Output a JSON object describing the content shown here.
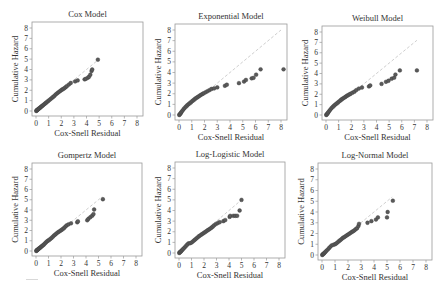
{
  "chart_data": [
    {
      "type": "scatter",
      "title": "Cox Model",
      "xlabel": "Cox-Snell Residual",
      "ylabel": "Cumulative Hazard",
      "xlim": [
        0,
        8
      ],
      "ylim": [
        0,
        8
      ],
      "xticks": [
        0,
        1,
        2,
        3,
        4,
        5,
        6,
        7,
        8
      ],
      "yticks": [
        0,
        1,
        2,
        3,
        4,
        5,
        6,
        7,
        8
      ],
      "grid": false,
      "reference_line": {
        "x": [
          0,
          5
        ],
        "y": [
          0,
          5
        ],
        "style": "dashed",
        "color": "#c8c8c8"
      },
      "x": [
        0.02,
        0.05,
        0.08,
        0.12,
        0.16,
        0.2,
        0.25,
        0.3,
        0.36,
        0.42,
        0.48,
        0.55,
        0.62,
        0.7,
        0.78,
        0.86,
        0.95,
        1.05,
        1.15,
        1.25,
        1.35,
        1.45,
        1.55,
        1.65,
        1.75,
        1.85,
        1.95,
        2.05,
        2.15,
        2.25,
        2.35,
        2.45,
        2.6,
        2.75,
        3.1,
        3.3,
        3.85,
        3.95,
        4.1,
        4.2,
        4.3,
        4.4,
        4.45,
        4.9
      ],
      "y": [
        0.0,
        0.05,
        0.08,
        0.12,
        0.16,
        0.2,
        0.25,
        0.3,
        0.36,
        0.42,
        0.48,
        0.55,
        0.62,
        0.7,
        0.78,
        0.86,
        0.95,
        1.05,
        1.15,
        1.25,
        1.35,
        1.45,
        1.58,
        1.68,
        1.78,
        1.87,
        1.96,
        2.05,
        2.12,
        2.2,
        2.3,
        2.4,
        2.55,
        2.7,
        2.85,
        2.95,
        3.05,
        3.1,
        3.2,
        3.3,
        3.5,
        3.85,
        4.0,
        4.95
      ]
    },
    {
      "type": "scatter",
      "title": "Exponential Model",
      "xlabel": "Cox-Snell Residual",
      "ylabel": "Cumulative Hazard",
      "xlim": [
        0,
        8
      ],
      "ylim": [
        0,
        8
      ],
      "xticks": [
        0,
        1,
        2,
        3,
        4,
        5,
        6,
        7,
        8
      ],
      "yticks": [
        0,
        1,
        2,
        3,
        4,
        5,
        6,
        7,
        8
      ],
      "grid": false,
      "reference_line": {
        "x": [
          0,
          8
        ],
        "y": [
          0,
          8
        ],
        "style": "dashed",
        "color": "#c8c8c8"
      },
      "x": [
        0.02,
        0.05,
        0.1,
        0.15,
        0.2,
        0.28,
        0.36,
        0.45,
        0.55,
        0.65,
        0.75,
        0.85,
        0.95,
        1.05,
        1.15,
        1.25,
        1.35,
        1.45,
        1.55,
        1.65,
        1.75,
        1.85,
        1.95,
        2.1,
        2.25,
        2.4,
        2.55,
        2.75,
        3.0,
        3.6,
        3.75,
        4.7,
        5.1,
        5.25,
        5.7,
        5.85,
        6.05,
        6.4,
        8.2
      ],
      "y": [
        0.0,
        0.05,
        0.12,
        0.2,
        0.3,
        0.42,
        0.55,
        0.68,
        0.8,
        0.92,
        1.02,
        1.12,
        1.22,
        1.32,
        1.42,
        1.52,
        1.6,
        1.68,
        1.76,
        1.84,
        1.92,
        1.98,
        2.05,
        2.15,
        2.25,
        2.35,
        2.45,
        2.5,
        2.6,
        2.75,
        2.85,
        3.0,
        3.15,
        3.3,
        3.45,
        3.5,
        3.8,
        4.3,
        4.3
      ]
    },
    {
      "type": "scatter",
      "title": "Weibull Model",
      "xlabel": "Cox-Snell Residual",
      "ylabel": "Cumulative Hazard",
      "xlim": [
        0,
        8
      ],
      "ylim": [
        0,
        8
      ],
      "xticks": [
        0,
        1,
        2,
        3,
        4,
        5,
        6,
        7,
        8
      ],
      "yticks": [
        0,
        1,
        2,
        3,
        4,
        5,
        6,
        7,
        8
      ],
      "grid": false,
      "reference_line": {
        "x": [
          0,
          7.2
        ],
        "y": [
          0,
          7.2
        ],
        "style": "dashed",
        "color": "#c8c8c8"
      },
      "x": [
        0.02,
        0.05,
        0.1,
        0.15,
        0.2,
        0.28,
        0.36,
        0.45,
        0.55,
        0.65,
        0.75,
        0.85,
        0.95,
        1.05,
        1.15,
        1.25,
        1.35,
        1.45,
        1.55,
        1.65,
        1.75,
        1.85,
        1.95,
        2.1,
        2.25,
        2.4,
        2.6,
        2.85,
        3.4,
        3.5,
        4.4,
        4.75,
        4.95,
        5.2,
        5.4,
        5.5,
        5.85,
        7.2
      ],
      "y": [
        0.0,
        0.05,
        0.12,
        0.2,
        0.3,
        0.42,
        0.55,
        0.68,
        0.8,
        0.92,
        1.02,
        1.12,
        1.22,
        1.32,
        1.42,
        1.52,
        1.6,
        1.68,
        1.76,
        1.84,
        1.92,
        1.98,
        2.05,
        2.15,
        2.25,
        2.4,
        2.55,
        2.65,
        2.75,
        2.85,
        3.0,
        3.2,
        3.3,
        3.5,
        3.6,
        3.9,
        4.3,
        4.3
      ]
    },
    {
      "type": "scatter",
      "title": "Gompertz Model",
      "xlabel": "Cox-Snell Residual",
      "ylabel": "Cumulative Hazard",
      "xlim": [
        0,
        8
      ],
      "ylim": [
        0,
        8
      ],
      "xticks": [
        0,
        1,
        2,
        3,
        4,
        5,
        6,
        7,
        8
      ],
      "yticks": [
        0,
        1,
        2,
        3,
        4,
        5,
        6,
        7,
        8
      ],
      "grid": false,
      "reference_line": {
        "x": [
          0,
          5.3
        ],
        "y": [
          0,
          5.3
        ],
        "style": "dashed",
        "color": "#c8c8c8"
      },
      "x": [
        0.02,
        0.05,
        0.08,
        0.12,
        0.16,
        0.2,
        0.25,
        0.3,
        0.36,
        0.42,
        0.48,
        0.55,
        0.62,
        0.7,
        0.78,
        0.86,
        0.95,
        1.05,
        1.15,
        1.25,
        1.35,
        1.45,
        1.55,
        1.65,
        1.75,
        1.85,
        1.95,
        2.05,
        2.15,
        2.25,
        2.35,
        2.45,
        2.6,
        2.8,
        3.3,
        3.35,
        4.1,
        4.2,
        4.35,
        4.5,
        4.6,
        4.65,
        5.35
      ],
      "y": [
        0.0,
        0.05,
        0.08,
        0.12,
        0.16,
        0.2,
        0.25,
        0.3,
        0.36,
        0.42,
        0.48,
        0.55,
        0.62,
        0.72,
        0.82,
        0.92,
        1.0,
        1.08,
        1.18,
        1.28,
        1.4,
        1.52,
        1.62,
        1.72,
        1.82,
        1.9,
        1.98,
        2.06,
        2.15,
        2.25,
        2.38,
        2.5,
        2.6,
        2.7,
        2.8,
        2.9,
        3.0,
        3.15,
        3.3,
        3.45,
        3.6,
        4.05,
        5.05
      ]
    },
    {
      "type": "scatter",
      "title": "Log-Logistic Model",
      "xlabel": "Cox-Snell Residual",
      "ylabel": "Cumulative Hazard",
      "xlim": [
        0,
        8
      ],
      "ylim": [
        0,
        8
      ],
      "xticks": [
        0,
        1,
        2,
        3,
        4,
        5,
        6,
        7,
        8
      ],
      "yticks": [
        0,
        1,
        2,
        3,
        4,
        5,
        6,
        7,
        8
      ],
      "grid": false,
      "reference_line": {
        "x": [
          0,
          5
        ],
        "y": [
          0,
          5
        ],
        "style": "dashed",
        "color": "#c8c8c8"
      },
      "x": [
        0.02,
        0.05,
        0.1,
        0.15,
        0.2,
        0.27,
        0.35,
        0.45,
        0.55,
        0.65,
        0.75,
        0.88,
        1.0,
        1.1,
        1.2,
        1.3,
        1.4,
        1.5,
        1.6,
        1.7,
        1.8,
        1.9,
        2.0,
        2.1,
        2.2,
        2.3,
        2.4,
        2.5,
        2.6,
        2.7,
        2.8,
        2.95,
        3.1,
        3.25,
        3.55,
        3.7,
        4.05,
        4.1,
        4.35,
        4.5,
        4.65,
        4.85,
        5.0
      ],
      "y": [
        0.0,
        0.05,
        0.1,
        0.15,
        0.22,
        0.3,
        0.4,
        0.52,
        0.65,
        0.78,
        0.9,
        0.92,
        0.98,
        1.08,
        1.18,
        1.28,
        1.38,
        1.48,
        1.58,
        1.66,
        1.74,
        1.82,
        1.9,
        1.98,
        2.06,
        2.14,
        2.22,
        2.3,
        2.38,
        2.48,
        2.6,
        2.72,
        2.82,
        2.9,
        3.0,
        3.1,
        3.4,
        3.5,
        3.5,
        3.5,
        3.5,
        4.0,
        5.0
      ]
    },
    {
      "type": "scatter",
      "title": "Log-Normal Model",
      "xlabel": "Cox-Snell Residual",
      "ylabel": "Cumulative Hazard",
      "xlim": [
        0,
        8
      ],
      "ylim": [
        0,
        8
      ],
      "xticks": [
        0,
        1,
        2,
        3,
        4,
        5,
        6,
        7,
        8
      ],
      "yticks": [
        0,
        1,
        2,
        3,
        4,
        5,
        6,
        7,
        8
      ],
      "grid": false,
      "reference_line": {
        "x": [
          0,
          5.4
        ],
        "y": [
          0,
          5.4
        ],
        "style": "dashed",
        "color": "#c8c8c8"
      },
      "x": [
        0.02,
        0.05,
        0.1,
        0.15,
        0.2,
        0.27,
        0.35,
        0.45,
        0.55,
        0.65,
        0.75,
        0.88,
        1.0,
        1.1,
        1.2,
        1.3,
        1.4,
        1.5,
        1.6,
        1.7,
        1.8,
        1.9,
        2.0,
        2.1,
        2.2,
        2.3,
        2.4,
        2.5,
        2.6,
        2.7,
        2.8,
        2.85,
        3.5,
        3.8,
        4.15,
        4.3,
        5.0,
        5.05,
        5.45
      ],
      "y": [
        0.0,
        0.05,
        0.1,
        0.15,
        0.22,
        0.3,
        0.4,
        0.52,
        0.65,
        0.78,
        0.9,
        0.95,
        1.0,
        1.08,
        1.18,
        1.28,
        1.38,
        1.48,
        1.58,
        1.66,
        1.74,
        1.82,
        1.9,
        1.98,
        2.06,
        2.14,
        2.22,
        2.3,
        2.4,
        2.5,
        2.7,
        2.9,
        3.0,
        3.15,
        3.3,
        3.5,
        3.5,
        4.0,
        5.05
      ]
    }
  ],
  "panels": [
    {
      "box": [
        32,
        22,
        143,
        116
      ]
    },
    {
      "box": [
        175,
        24,
        287,
        120
      ]
    },
    {
      "box": [
        322,
        26,
        433,
        120
      ]
    },
    {
      "box": [
        32,
        163,
        142,
        256
      ]
    },
    {
      "box": [
        175,
        162,
        285,
        258
      ]
    },
    {
      "box": [
        318,
        163,
        432,
        260
      ]
    }
  ],
  "style": {
    "point_color": "#5a5a5a",
    "point_edge": "#3a3a3a",
    "axis_color": "#9a9a9a",
    "text_color": "#333333",
    "refline_color": "#c8c8c8"
  }
}
